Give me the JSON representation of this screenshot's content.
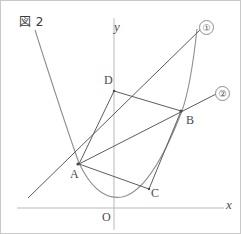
{
  "figure": {
    "caption": "図 2",
    "width": 241,
    "height": 234,
    "background_color": "#ffffff",
    "border_color": "#c8c8c8",
    "axis_color": "#b9b9b9",
    "curve_color": "#8f8f8f",
    "line_color": "#5c5c5c",
    "label_color": "#4a4a4a"
  },
  "axes": {
    "y_axis_label": "y",
    "x_axis_label": "x",
    "origin_label": "O",
    "origin_px": {
      "x": 113,
      "y": 207
    },
    "y_axis": {
      "x": 113,
      "y_top": 17,
      "y_bottom": 229
    },
    "x_axis": {
      "y": 207,
      "x_left": 16,
      "x_right": 223
    }
  },
  "points": [
    {
      "name": "A",
      "label": "A",
      "px": {
        "x": 77,
        "y": 163
      }
    },
    {
      "name": "B",
      "label": "B",
      "px": {
        "x": 180,
        "y": 110
      }
    },
    {
      "name": "C",
      "label": "C",
      "px": {
        "x": 148,
        "y": 188
      }
    },
    {
      "name": "D",
      "label": "D",
      "px": {
        "x": 113,
        "y": 90
      }
    }
  ],
  "curves": [
    {
      "name": "parabola",
      "kind": "parabola",
      "opens": "up",
      "vertex_px": {
        "x": 120,
        "y": 196
      },
      "passes_through": [
        "A",
        "C",
        "B"
      ],
      "path": "M 34 29 Q 63 120 78 162 Q 96 200 121 196 Q 150 190 181 110 Q 190 84 196 28"
    }
  ],
  "lines": [
    {
      "name": "line-1",
      "label": "①",
      "through": [
        "A",
        "B"
      ],
      "description": "steep line through A and B rising to upper right",
      "path": "M 27 197 L 203 25"
    },
    {
      "name": "line-2",
      "label": "②",
      "through": [
        "B"
      ],
      "description": "shallower line through B rising to the right toward label 2",
      "path": "M 78 163 L 219 91"
    }
  ],
  "segments": [
    {
      "name": "segment-AD",
      "from": "A",
      "to": "D",
      "path": "M 78 163 L 113 90"
    },
    {
      "name": "segment-DB",
      "from": "D",
      "to": "B",
      "path": "M 113 90 L 180 110"
    },
    {
      "name": "segment-AC",
      "from": "A",
      "to": "C",
      "path": "M 78 163 L 148 188"
    },
    {
      "name": "segment-CB",
      "from": "C",
      "to": "B",
      "path": "M 148 188 L 180 110"
    }
  ],
  "labels": {
    "circled_1": "①",
    "circled_2": "②"
  }
}
